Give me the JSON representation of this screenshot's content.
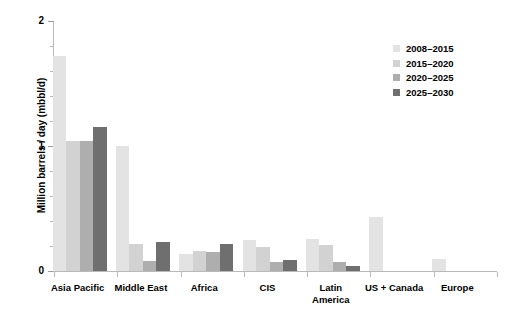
{
  "chart_data": {
    "type": "bar",
    "title": "",
    "subtitle": "",
    "xlabel": "",
    "ylabel": "Million barrels / day (mbbl/d)",
    "ylim": [
      0,
      2
    ],
    "ytick_labels": [
      "0",
      "1",
      "2"
    ],
    "ytick_values": [
      0,
      1,
      2
    ],
    "yminor_step": 0.2,
    "grid": false,
    "legend_position": "top-right",
    "categories": [
      "Asia Pacific",
      "Middle East",
      "Africa",
      "CIS",
      "Latin\nAmerica",
      "US + Canada",
      "Europe"
    ],
    "series": [
      {
        "name": "2008–2015",
        "color": "#e3e3e3",
        "values": [
          1.72,
          1.0,
          0.14,
          0.25,
          0.26,
          0.43,
          0.1
        ]
      },
      {
        "name": "2015–2020",
        "color": "#d2d2d2",
        "values": [
          1.04,
          0.22,
          0.16,
          0.19,
          0.21,
          0.0,
          0.0
        ]
      },
      {
        "name": "2020–2025",
        "color": "#aeaeae",
        "values": [
          1.04,
          0.08,
          0.15,
          0.07,
          0.07,
          0.0,
          0.0
        ]
      },
      {
        "name": "2025–2030",
        "color": "#6f6f6f",
        "values": [
          1.15,
          0.23,
          0.22,
          0.09,
          0.04,
          0.0,
          0.0
        ]
      }
    ]
  },
  "legend": {
    "items": [
      {
        "label": "2008–2015",
        "color": "#e3e3e3"
      },
      {
        "label": "2015–2020",
        "color": "#d2d2d2"
      },
      {
        "label": "2020–2025",
        "color": "#aeaeae"
      },
      {
        "label": "2025–2030",
        "color": "#6f6f6f"
      }
    ]
  },
  "axes": {
    "y_label": "Million barrels / day (mbbl/d)",
    "y_ticks": [
      "2",
      "1",
      "0"
    ]
  }
}
